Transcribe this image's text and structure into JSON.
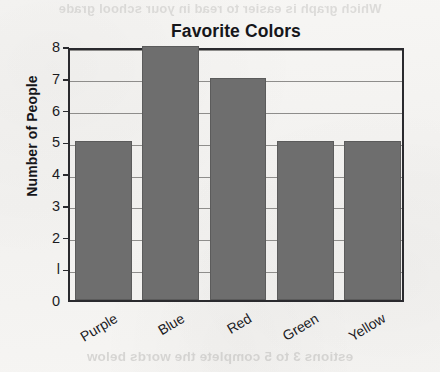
{
  "page": {
    "background_color": "#f5f4f2",
    "bleed_through_top": "Which graph is easier to read in your school grade",
    "bleed_through_bottom": "estions 3 to 5 complete the words below"
  },
  "chart_data": {
    "type": "bar",
    "title": "Favorite Colors",
    "xlabel": "",
    "ylabel": "Number of People",
    "categories": [
      "Purple",
      "Blue",
      "Red",
      "Green",
      "Yellow"
    ],
    "values": [
      5,
      8,
      7,
      5,
      5
    ],
    "ylim": [
      0,
      8
    ],
    "ytick_labels": [
      "0",
      "l",
      "2",
      "3",
      "4",
      "5",
      "6",
      "7",
      "8"
    ],
    "grid": true,
    "legend": "none",
    "bar_color": "#6e6e6e",
    "bar_edge_color": "#5b5b5b",
    "axis_color": "#2a2a2e",
    "gridline_color": "#8e8d8b",
    "xtick_label_rotation": -31
  }
}
